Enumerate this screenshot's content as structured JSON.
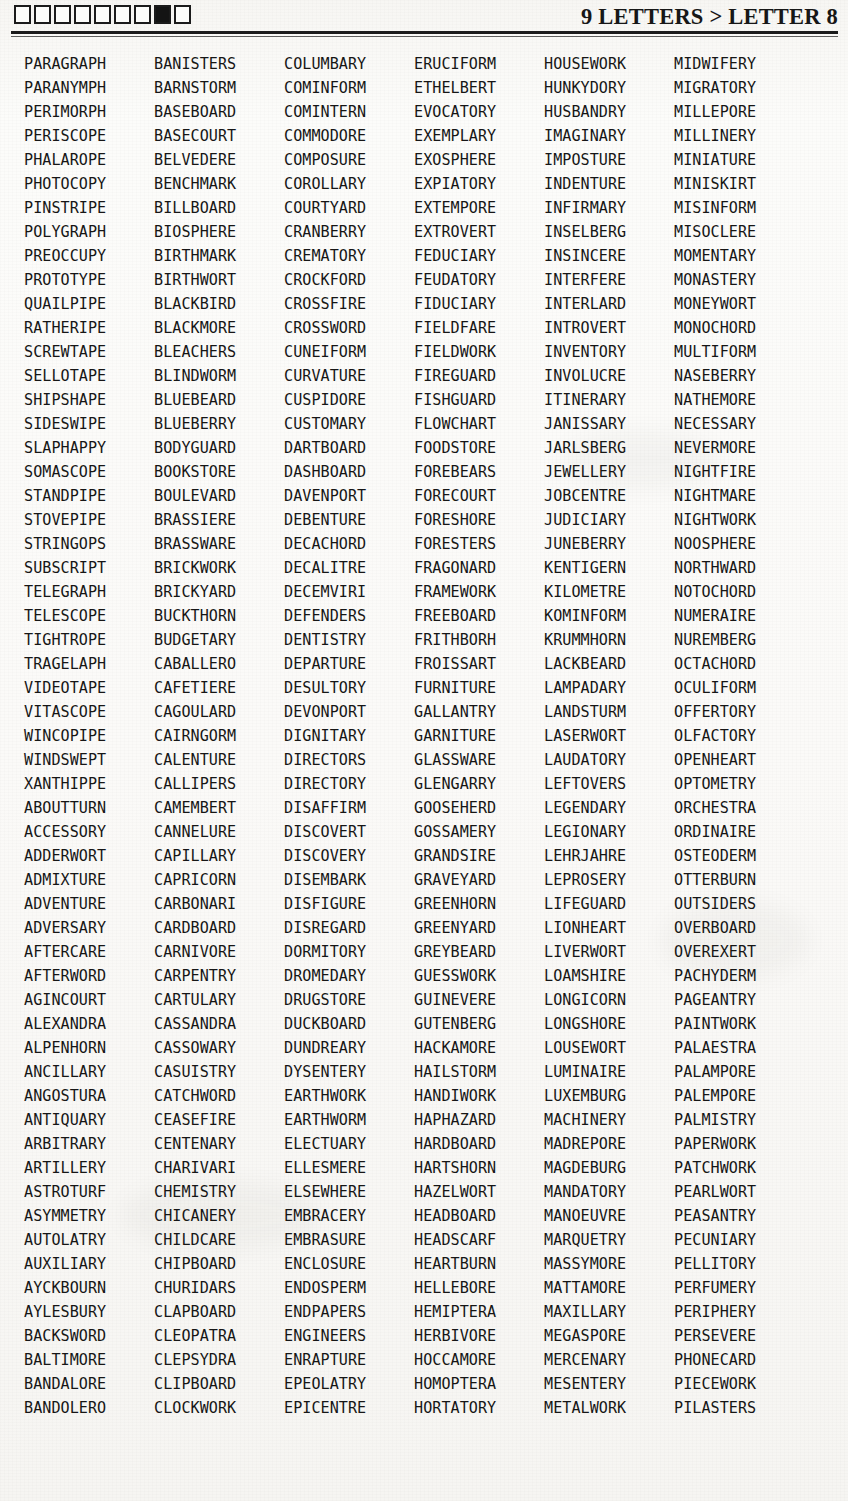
{
  "header": {
    "title": "9 LETTERS > LETTER 8",
    "letter_boxes": [
      {
        "index": 1,
        "filled": false
      },
      {
        "index": 2,
        "filled": false
      },
      {
        "index": 3,
        "filled": false
      },
      {
        "index": 4,
        "filled": false
      },
      {
        "index": 5,
        "filled": false
      },
      {
        "index": 6,
        "filled": false
      },
      {
        "index": 7,
        "filled": false
      },
      {
        "index": 8,
        "filled": true
      },
      {
        "index": 9,
        "filled": false
      }
    ],
    "ink_color": "#161616",
    "paper_color": "#fbfaf8"
  },
  "word_list": {
    "columns": [
      {
        "index": 1,
        "words": [
          "PARAGRAPH",
          "PARANYMPH",
          "PERIMORPH",
          "PERISCOPE",
          "PHALAROPE",
          "PHOTOCOPY",
          "PINSTRIPE",
          "POLYGRAPH",
          "PREOCCUPY",
          "PROTOTYPE",
          "QUAILPIPE",
          "RATHERIPE",
          "SCREWTAPE",
          "SELLOTAPE",
          "SHIPSHAPE",
          "SIDESWIPE",
          "SLAPHAPPY",
          "SOMASCOPE",
          "STANDPIPE",
          "STOVEPIPE",
          "STRINGOPS",
          "SUBSCRIPT",
          "TELEGRAPH",
          "TELESCOPE",
          "TIGHTROPE",
          "TRAGELAPH",
          "VIDEOTAPE",
          "VITASCOPE",
          "WINCOPIPE",
          "WINDSWEPT",
          "XANTHIPPE",
          "ABOUTTURN",
          "ACCESSORY",
          "ADDERWORT",
          "ADMIXTURE",
          "ADVENTURE",
          "ADVERSARY",
          "AFTERCARE",
          "AFTERWORD",
          "AGINCOURT",
          "ALEXANDRA",
          "ALPENHORN",
          "ANCILLARY",
          "ANGOSTURA",
          "ANTIQUARY",
          "ARBITRARY",
          "ARTILLERY",
          "ASTROTURF",
          "ASYMMETRY",
          "AUTOLATRY",
          "AUXILIARY",
          "AYCKBOURN",
          "AYLESBURY",
          "BACKSWORD",
          "BALTIMORE",
          "BANDALORE",
          "BANDOLERO"
        ]
      },
      {
        "index": 2,
        "words": [
          "BANISTERS",
          "BARNSTORM",
          "BASEBOARD",
          "BASECOURT",
          "BELVEDERE",
          "BENCHMARK",
          "BILLBOARD",
          "BIOSPHERE",
          "BIRTHMARK",
          "BIRTHWORT",
          "BLACKBIRD",
          "BLACKMORE",
          "BLEACHERS",
          "BLINDWORM",
          "BLUEBEARD",
          "BLUEBERRY",
          "BODYGUARD",
          "BOOKSTORE",
          "BOULEVARD",
          "BRASSIERE",
          "BRASSWARE",
          "BRICKWORK",
          "BRICKYARD",
          "BUCKTHORN",
          "BUDGETARY",
          "CABALLERO",
          "CAFETIERE",
          "CAGOULARD",
          "CAIRNGORM",
          "CALENTURE",
          "CALLIPERS",
          "CAMEMBERT",
          "CANNELURE",
          "CAPILLARY",
          "CAPRICORN",
          "CARBONARI",
          "CARDBOARD",
          "CARNIVORE",
          "CARPENTRY",
          "CARTULARY",
          "CASSANDRA",
          "CASSOWARY",
          "CASUISTRY",
          "CATCHWORD",
          "CEASEFIRE",
          "CENTENARY",
          "CHARIVARI",
          "CHEMISTRY",
          "CHICANERY",
          "CHILDCARE",
          "CHIPBOARD",
          "CHURIDARS",
          "CLAPBOARD",
          "CLEOPATRA",
          "CLEPSYDRA",
          "CLIPBOARD",
          "CLOCKWORK"
        ]
      },
      {
        "index": 3,
        "words": [
          "COLUMBARY",
          "COMINFORM",
          "COMINTERN",
          "COMMODORE",
          "COMPOSURE",
          "COROLLARY",
          "COURTYARD",
          "CRANBERRY",
          "CREMATORY",
          "CROCKFORD",
          "CROSSFIRE",
          "CROSSWORD",
          "CUNEIFORM",
          "CURVATURE",
          "CUSPIDORE",
          "CUSTOMARY",
          "DARTBOARD",
          "DASHBOARD",
          "DAVENPORT",
          "DEBENTURE",
          "DECACHORD",
          "DECALITRE",
          "DECEMVIRI",
          "DEFENDERS",
          "DENTISTRY",
          "DEPARTURE",
          "DESULTORY",
          "DEVONPORT",
          "DIGNITARY",
          "DIRECTORS",
          "DIRECTORY",
          "DISAFFIRM",
          "DISCOVERT",
          "DISCOVERY",
          "DISEMBARK",
          "DISFIGURE",
          "DISREGARD",
          "DORMITORY",
          "DROMEDARY",
          "DRUGSTORE",
          "DUCKBOARD",
          "DUNDREARY",
          "DYSENTERY",
          "EARTHWORK",
          "EARTHWORM",
          "ELECTUARY",
          "ELLESMERE",
          "ELSEWHERE",
          "EMBRACERY",
          "EMBRASURE",
          "ENCLOSURE",
          "ENDOSPERM",
          "ENDPAPERS",
          "ENGINEERS",
          "ENRAPTURE",
          "EPEOLATRY",
          "EPICENTRE"
        ]
      },
      {
        "index": 4,
        "words": [
          "ERUCIFORM",
          "ETHELBERT",
          "EVOCATORY",
          "EXEMPLARY",
          "EXOSPHERE",
          "EXPIATORY",
          "EXTEMPORE",
          "EXTROVERT",
          "FEDUCIARY",
          "FEUDATORY",
          "FIDUCIARY",
          "FIELDFARE",
          "FIELDWORK",
          "FIREGUARD",
          "FISHGUARD",
          "FLOWCHART",
          "FOODSTORE",
          "FOREBEARS",
          "FORECOURT",
          "FORESHORE",
          "FORESTERS",
          "FRAGONARD",
          "FRAMEWORK",
          "FREEBOARD",
          "FRITHBORH",
          "FROISSART",
          "FURNITURE",
          "GALLANTRY",
          "GARNITURE",
          "GLASSWARE",
          "GLENGARRY",
          "GOOSEHERD",
          "GOSSAMERY",
          "GRANDSIRE",
          "GRAVEYARD",
          "GREENHORN",
          "GREENYARD",
          "GREYBEARD",
          "GUESSWORK",
          "GUINEVERE",
          "GUTENBERG",
          "HACKAMORE",
          "HAILSTORM",
          "HANDIWORK",
          "HAPHAZARD",
          "HARDBOARD",
          "HARTSHORN",
          "HAZELWORT",
          "HEADBOARD",
          "HEADSCARF",
          "HEARTBURN",
          "HELLEBORE",
          "HEMIPTERA",
          "HERBIVORE",
          "HOCCAMORE",
          "HOMOPTERA",
          "HORTATORY"
        ]
      },
      {
        "index": 5,
        "words": [
          "HOUSEWORK",
          "HUNKYDORY",
          "HUSBANDRY",
          "IMAGINARY",
          "IMPOSTURE",
          "INDENTURE",
          "INFIRMARY",
          "INSELBERG",
          "INSINCERE",
          "INTERFERE",
          "INTERLARD",
          "INTROVERT",
          "INVENTORY",
          "INVOLUCRE",
          "ITINERARY",
          "JANISSARY",
          "JARLSBERG",
          "JEWELLERY",
          "JOBCENTRE",
          "JUDICIARY",
          "JUNEBERRY",
          "KENTIGERN",
          "KILOMETRE",
          "KOMINFORM",
          "KRUMMHORN",
          "LACKBEARD",
          "LAMPADARY",
          "LANDSTURM",
          "LASERWORT",
          "LAUDATORY",
          "LEFTOVERS",
          "LEGENDARY",
          "LEGIONARY",
          "LEHRJAHRE",
          "LEPROSERY",
          "LIFEGUARD",
          "LIONHEART",
          "LIVERWORT",
          "LOAMSHIRE",
          "LONGICORN",
          "LONGSHORE",
          "LOUSEWORT",
          "LUMINAIRE",
          "LUXEMBURG",
          "MACHINERY",
          "MADREPORE",
          "MAGDEBURG",
          "MANDATORY",
          "MANOEUVRE",
          "MARQUETRY",
          "MASSYMORE",
          "MATTAMORE",
          "MAXILLARY",
          "MEGASPORE",
          "MERCENARY",
          "MESENTERY",
          "METALWORK"
        ]
      },
      {
        "index": 6,
        "words": [
          "MIDWIFERY",
          "MIGRATORY",
          "MILLEPORE",
          "MILLINERY",
          "MINIATURE",
          "MINISKIRT",
          "MISINFORM",
          "MISOCLERE",
          "MOMENTARY",
          "MONASTERY",
          "MONEYWORT",
          "MONOCHORD",
          "MULTIFORM",
          "NASEBERRY",
          "NATHEMORE",
          "NECESSARY",
          "NEVERMORE",
          "NIGHTFIRE",
          "NIGHTMARE",
          "NIGHTWORK",
          "NOOSPHERE",
          "NORTHWARD",
          "NOTOCHORD",
          "NUMERAIRE",
          "NUREMBERG",
          "OCTACHORD",
          "OCULIFORM",
          "OFFERTORY",
          "OLFACTORY",
          "OPENHEART",
          "OPTOMETRY",
          "ORCHESTRA",
          "ORDINAIRE",
          "OSTEODERM",
          "OTTERBURN",
          "OUTSIDERS",
          "OVERBOARD",
          "OVEREXERT",
          "PACHYDERM",
          "PAGEANTRY",
          "PAINTWORK",
          "PALAESTRA",
          "PALAMPORE",
          "PALEMPORE",
          "PALMISTRY",
          "PAPERWORK",
          "PATCHWORK",
          "PEARLWORT",
          "PEASANTRY",
          "PECUNIARY",
          "PELLITORY",
          "PERFUMERY",
          "PERIPHERY",
          "PERSEVERE",
          "PHONECARD",
          "PIECEWORK",
          "PILASTERS"
        ]
      }
    ]
  }
}
